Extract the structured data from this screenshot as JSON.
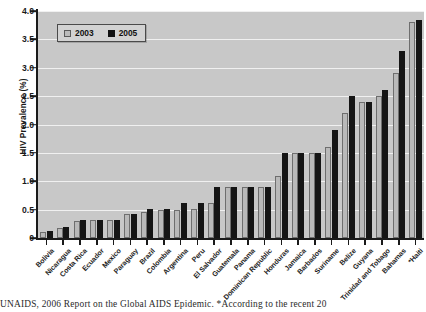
{
  "chart_data": {
    "type": "bar",
    "title": "",
    "xlabel": "",
    "ylabel": "HIV Prevalence (%)",
    "ylim": [
      0,
      4.0
    ],
    "yticks": [
      "0",
      "0.5",
      "1.0",
      "1.5",
      "2.0",
      "2.5",
      "3.0",
      "3.5",
      "4.0"
    ],
    "ytick_values": [
      0,
      0.5,
      1.0,
      1.5,
      2.0,
      2.5,
      3.0,
      3.5,
      4.0
    ],
    "grid": true,
    "legend_position": "top-left",
    "categories": [
      "Bolivia",
      "Nicaragua",
      "Costa Rica",
      "Ecuador",
      "Mexico",
      "Paraguay",
      "Brazil",
      "Colombia",
      "Argentina",
      "Peru",
      "El Salvador",
      "Guatemala",
      "Panama",
      "Dominican Republic",
      "Honduras",
      "Jamaica",
      "Barbados",
      "Suriname",
      "Belize",
      "Guyana",
      "Trinidad and Tobago",
      "Bahamas",
      "*Haiti"
    ],
    "series": [
      {
        "name": "2003",
        "color": "#b9b9b9",
        "values": [
          0.11,
          0.18,
          0.3,
          0.32,
          0.32,
          0.42,
          0.45,
          0.5,
          0.5,
          0.52,
          0.62,
          0.9,
          0.9,
          0.9,
          1.1,
          1.5,
          1.5,
          1.6,
          2.2,
          2.4,
          2.5,
          2.9,
          3.8
        ]
      },
      {
        "name": "2005",
        "color": "#151515",
        "values": [
          0.12,
          0.19,
          0.32,
          0.32,
          0.32,
          0.42,
          0.52,
          0.52,
          0.62,
          0.62,
          0.9,
          0.9,
          0.9,
          0.9,
          1.5,
          1.5,
          1.5,
          1.9,
          2.5,
          2.4,
          2.6,
          3.3,
          3.85
        ]
      }
    ]
  },
  "legend": {
    "items": [
      {
        "label": "2003",
        "swatch": "light-gray-square"
      },
      {
        "label": "2005",
        "swatch": "black-square"
      }
    ]
  },
  "caption": {
    "text": "UNAIDS, 2006 Report on the Global AIDS Epidemic. *According to the recent 20"
  }
}
